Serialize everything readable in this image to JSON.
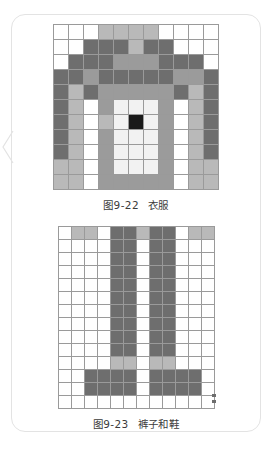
{
  "page": {
    "background": "#ffffff",
    "card_border_color": "#e3e3e3"
  },
  "palette": {
    "white": "#ffffff",
    "light": "#f2f2f2",
    "light_gray": "#b9b9b9",
    "mid_gray": "#9b9b9b",
    "dark_gray": "#6e6e6e",
    "black": "#1a1a1a",
    "grid_line": "#9a9a9a"
  },
  "figures": [
    {
      "id": "figure-clothes",
      "name": "clothes-chart",
      "caption_number": "图9-22",
      "caption_text": "衣服",
      "cell_size": 15,
      "columns": 11,
      "rows": 11,
      "legend": {
        "W": "#ffffff",
        "L": "#f2f2f2",
        "G": "#b9b9b9",
        "M": "#9b9b9b",
        "D": "#6e6e6e",
        "K": "#1a1a1a"
      },
      "pattern": [
        "WWWGGGGWWWW",
        "WWDDDGDDWWW",
        "WDDDMMMDDDW",
        "DDMDDDDDMMD",
        "DGDMMMMMDGD",
        "DGWMLLLMWGD",
        "DGWGLKLMWGD",
        "DGWMLLLMWGD",
        "DGWMLLLMWGD",
        "GGWMLLLMWGG",
        "GGWMMMMMWGG"
      ]
    },
    {
      "id": "figure-pants",
      "name": "pants-and-shoes-chart",
      "caption_number": "图9-23",
      "caption_text": "裤子和鞋",
      "cell_size": 13,
      "columns": 11,
      "rows": 14,
      "legend": {
        "W": "#ffffff",
        "G": "#b9b9b9",
        "D": "#6e6e6e"
      },
      "pattern": [
        "WGGWDDGDDWGG",
        "WWWWDDWDDWWW",
        "WWWWDDWDDWWW",
        "WWWWDDWDDWWW",
        "WWWWDDWDDWWW",
        "WWWWDDWDDWWW",
        "WWWWDDWDDWWW",
        "WWWWDDWDDWWW",
        "WWWWDDWDDWWW",
        "WWWWDDWDDWWW",
        "WWWWGGWGGWWW",
        "WWDDDDWDDDDW",
        "WWDDDDWDDDDW",
        "WWWWWWWWWWWW"
      ]
    }
  ]
}
